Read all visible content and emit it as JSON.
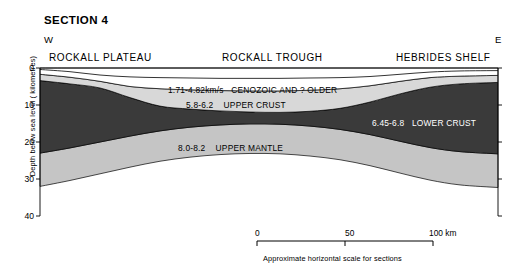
{
  "title": "SECTION 4",
  "compass": {
    "west": "W",
    "east": "E"
  },
  "regions": {
    "plateau": "ROCKALL PLATEAU",
    "trough": "ROCKALL TROUGH",
    "shelf": "HEBRIDES SHELF"
  },
  "axis": {
    "y_label": "Depth below sea level ( kilometres)",
    "y_ticks": [
      "0",
      "10",
      "20",
      "30",
      "40"
    ],
    "y_values": [
      0,
      10,
      20,
      30,
      40
    ]
  },
  "layers": [
    {
      "key": "cenozoic",
      "velocity": "1.71-4.82km/s",
      "name": "CENOZOIC AND ? OLDER",
      "color": "#ffffff"
    },
    {
      "key": "upper_crust",
      "velocity": "5.8-6.2",
      "name": "UPPER CRUST",
      "color": "#d8d8d8"
    },
    {
      "key": "lower_crust",
      "velocity": "6.45-6.8",
      "name": "LOWER CRUST",
      "color": "#3a3a3a"
    },
    {
      "key": "upper_mantle",
      "velocity": "8.0-8.2",
      "name": "UPPER MANTLE",
      "color": "#c5c5c5"
    }
  ],
  "scale_bar": {
    "ticks": [
      "0",
      "50",
      "100 km"
    ],
    "caption": "Approximate horizontal scale for sections"
  },
  "chart_data": {
    "type": "area",
    "title": "SECTION 4",
    "xlabel": "Approximate horizontal scale for sections",
    "ylabel": "Depth below sea level ( kilometres)",
    "ylim": [
      0,
      40
    ],
    "xlim_km": [
      0,
      100
    ],
    "y_inverted": true,
    "grid": false,
    "legend": "inline-labels",
    "x_pixels": [
      40,
      70,
      100,
      130,
      160,
      190,
      220,
      250,
      280,
      310,
      340,
      370,
      400,
      430,
      460,
      498
    ],
    "series": [
      {
        "name": "seabed",
        "note": "top of CENOZOIC AND ? OLDER (white layer)",
        "depth_km": [
          0.4,
          1.0,
          1.9,
          2.4,
          2.6,
          2.7,
          2.8,
          2.8,
          2.8,
          2.7,
          2.6,
          2.3,
          1.7,
          1.1,
          0.8,
          0.7
        ]
      },
      {
        "name": "base_cenozoic",
        "note": "top of UPPER CRUST (light grey)",
        "depth_km": [
          1.7,
          2.5,
          3.6,
          5.0,
          5.6,
          5.9,
          6.1,
          6.2,
          6.2,
          6.0,
          5.6,
          4.8,
          3.6,
          2.6,
          2.2,
          2.0
        ]
      },
      {
        "name": "base_upper_crust",
        "note": "top of LOWER CRUST (dark)",
        "depth_km": [
          3.4,
          4.3,
          5.4,
          8.0,
          10.3,
          11.1,
          11.6,
          11.9,
          12.0,
          11.7,
          10.9,
          9.2,
          7.0,
          5.2,
          4.3,
          3.9
        ]
      },
      {
        "name": "moho",
        "note": "base of LOWER CRUST / top of UPPER MANTLE",
        "depth_km": [
          23.0,
          21.6,
          20.0,
          18.4,
          17.0,
          16.0,
          15.4,
          15.1,
          15.2,
          15.7,
          16.6,
          18.0,
          19.8,
          21.5,
          22.6,
          23.2
        ]
      },
      {
        "name": "base_upper_mantle",
        "note": "bottom of plotted UPPER MANTLE band",
        "depth_km": [
          32.0,
          30.4,
          28.6,
          26.8,
          25.2,
          24.1,
          23.4,
          23.1,
          23.2,
          23.8,
          24.8,
          26.4,
          28.4,
          30.3,
          31.6,
          32.3
        ]
      }
    ],
    "annotations": [
      {
        "text": "1.71-4.82km/s  CENOZOIC AND ? OLDER",
        "layer": "cenozoic"
      },
      {
        "text": "5.8-6.2  UPPER CRUST",
        "layer": "upper_crust"
      },
      {
        "text": "6.45-6.8  LOWER CRUST",
        "layer": "lower_crust"
      },
      {
        "text": "8.0-8.2  UPPER MANTLE",
        "layer": "upper_mantle"
      },
      {
        "text": "ROCKALL PLATEAU",
        "kind": "region"
      },
      {
        "text": "ROCKALL TROUGH",
        "kind": "region"
      },
      {
        "text": "HEBRIDES SHELF",
        "kind": "region"
      }
    ]
  }
}
